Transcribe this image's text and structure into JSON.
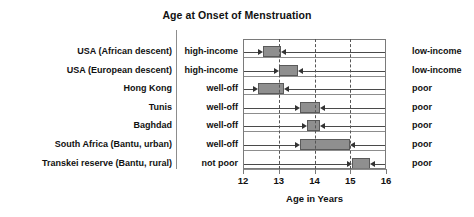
{
  "chart_data": {
    "type": "bar",
    "title": "Age at Onset of Menstruation",
    "xlabel": "Age in Years",
    "ylabel": "",
    "xlim": [
      12,
      16
    ],
    "xticks": [
      12,
      13,
      14,
      15,
      16
    ],
    "xtick_labels": [
      "12",
      "13",
      "14",
      "15",
      "16"
    ],
    "grid": "vertical dashed at 13, 14, 15",
    "legend": "none (inline left/right group labels)",
    "orientation": "horizontal range bars with inward arrows",
    "left_group_header": "",
    "right_group_header": "",
    "categories": [
      "USA (African descent)",
      "USA (European descent)",
      "Hong Kong",
      "Tunis",
      "Baghdad",
      "South Africa (Bantu, urban)",
      "Transkei reserve (Bantu, rural)"
    ],
    "left_conditions": [
      "high-income",
      "high-income",
      "well-off",
      "well-off",
      "well-off",
      "well-off",
      "not poor"
    ],
    "right_conditions": [
      "low-income",
      "low-income",
      "poor",
      "poor",
      "poor",
      "poor",
      "poor"
    ],
    "ranges": [
      {
        "category": "USA (African descent)",
        "start": 12.55,
        "end": 13.05
      },
      {
        "category": "USA (European descent)",
        "start": 13.0,
        "end": 13.55
      },
      {
        "category": "Hong Kong",
        "start": 12.42,
        "end": 13.15
      },
      {
        "category": "Tunis",
        "start": 13.6,
        "end": 14.15
      },
      {
        "category": "Baghdad",
        "start": 13.8,
        "end": 14.15
      },
      {
        "category": "South Africa (Bantu, urban)",
        "start": 13.6,
        "end": 15.0
      },
      {
        "category": "Transkei reserve (Bantu, rural)",
        "start": 15.05,
        "end": 15.55
      }
    ],
    "colors": {
      "bar_fill": "#8f8f8f",
      "bar_stroke": "#5a5a5a",
      "axis": "#7a7a7a",
      "grid": "#555555",
      "text": "#111111",
      "background": "#ffffff"
    }
  }
}
